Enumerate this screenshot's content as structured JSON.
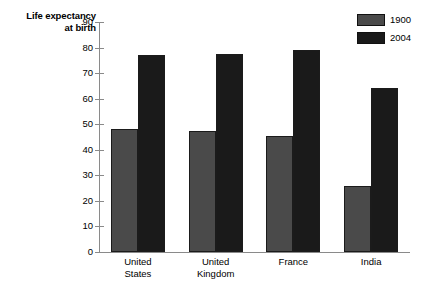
{
  "chart_data": {
    "type": "bar",
    "title": "Life expectancy at birth",
    "title_line1": "Life expectancy",
    "title_line2": "at birth",
    "xlabel": "",
    "ylabel": "Life expectancy at birth",
    "categories": [
      "United States",
      "United Kingdom",
      "France",
      "India"
    ],
    "categories_wrapped": [
      {
        "line1": "United",
        "line2": "States"
      },
      {
        "line1": "United",
        "line2": "Kingdom"
      },
      {
        "line1": "France",
        "line2": ""
      },
      {
        "line1": "India",
        "line2": ""
      }
    ],
    "series": [
      {
        "name": "1900",
        "color": "#4a4a4a",
        "values": [
          48,
          47.5,
          45.5,
          26
        ]
      },
      {
        "name": "2004",
        "color": "#1a1a1a",
        "values": [
          77,
          77.5,
          79,
          64
        ]
      }
    ],
    "ylim": [
      0,
      90
    ],
    "ytick_step": 10,
    "yticks": [
      0,
      10,
      20,
      30,
      40,
      50,
      60,
      70,
      80,
      90
    ],
    "ytick_labels": [
      "0",
      "10",
      "20",
      "30",
      "40",
      "50",
      "60",
      "70",
      "80",
      "90"
    ],
    "grid": false,
    "legend_position": "top-right",
    "legend": [
      {
        "label": "1900",
        "color": "#4a4a4a"
      },
      {
        "label": "2004",
        "color": "#1a1a1a"
      }
    ],
    "background_color": "#ffffff",
    "axis_color": "#8a8a8a"
  }
}
